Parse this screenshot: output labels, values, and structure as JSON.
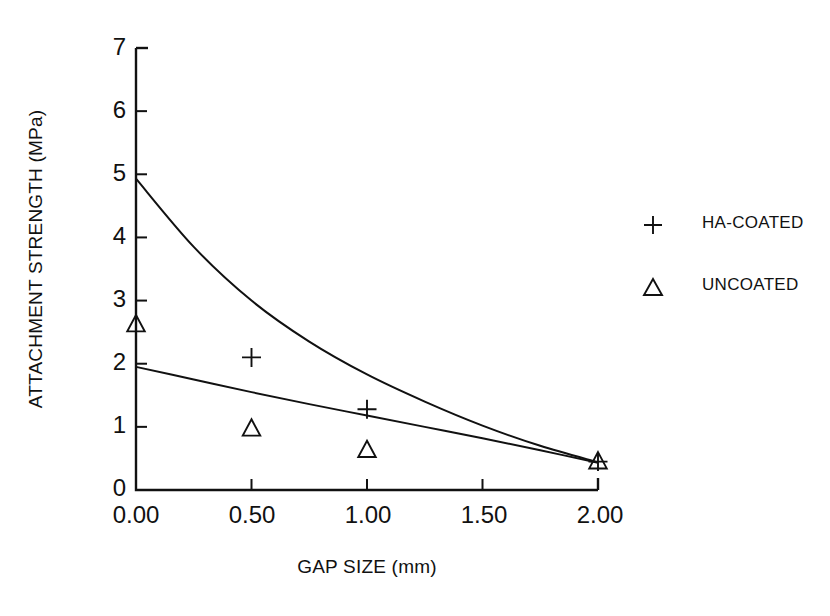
{
  "chart_data": {
    "type": "line",
    "title": "",
    "subtitle": "",
    "xlabel": "GAP SIZE (mm)",
    "ylabel": "ATTACHMENT STRENGTH (MPa)",
    "xlim": [
      0.0,
      2.0
    ],
    "ylim": [
      0,
      7
    ],
    "xticks": [
      "0.00",
      "0.50",
      "1.00",
      "1.50",
      "2.00"
    ],
    "xtick_values": [
      0.0,
      0.5,
      1.0,
      1.5,
      2.0
    ],
    "yticks": [
      "0",
      "1",
      "2",
      "3",
      "4",
      "5",
      "6",
      "7"
    ],
    "ytick_values": [
      0,
      1,
      2,
      3,
      4,
      5,
      6,
      7
    ],
    "grid": false,
    "legend_position": "right",
    "series": [
      {
        "name": "HA-COATED",
        "marker": "plus",
        "points": [
          {
            "x": 0.5,
            "y": 2.1
          },
          {
            "x": 1.0,
            "y": 1.28
          },
          {
            "x": 2.0,
            "y": 0.45
          }
        ],
        "fit_curve": [
          {
            "x": 0.0,
            "y": 4.93
          },
          {
            "x": 0.25,
            "y": 3.85
          },
          {
            "x": 0.5,
            "y": 3.0
          },
          {
            "x": 0.75,
            "y": 2.35
          },
          {
            "x": 1.0,
            "y": 1.83
          },
          {
            "x": 1.25,
            "y": 1.4
          },
          {
            "x": 1.5,
            "y": 1.02
          },
          {
            "x": 1.75,
            "y": 0.7
          },
          {
            "x": 2.0,
            "y": 0.44
          }
        ]
      },
      {
        "name": "UNCOATED",
        "marker": "triangle",
        "points": [
          {
            "x": 0.0,
            "y": 2.62
          },
          {
            "x": 0.5,
            "y": 0.97
          },
          {
            "x": 1.0,
            "y": 0.63
          },
          {
            "x": 2.0,
            "y": 0.45
          }
        ],
        "fit_curve": [
          {
            "x": 0.0,
            "y": 1.95
          },
          {
            "x": 0.25,
            "y": 1.75
          },
          {
            "x": 0.5,
            "y": 1.55
          },
          {
            "x": 0.75,
            "y": 1.36
          },
          {
            "x": 1.0,
            "y": 1.18
          },
          {
            "x": 1.25,
            "y": 1.0
          },
          {
            "x": 1.5,
            "y": 0.82
          },
          {
            "x": 1.75,
            "y": 0.63
          },
          {
            "x": 2.0,
            "y": 0.43
          }
        ]
      }
    ],
    "legend": [
      {
        "marker": "plus",
        "label": "HA-COATED"
      },
      {
        "marker": "triangle",
        "label": "UNCOATED"
      }
    ],
    "colors": {
      "foreground": "#111111",
      "background": "#ffffff"
    }
  }
}
